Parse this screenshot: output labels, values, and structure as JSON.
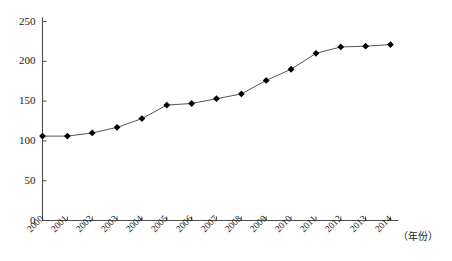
{
  "chart_data": {
    "type": "line",
    "title": "",
    "subtitle": "",
    "xlabel": "（年份）",
    "ylabel": "",
    "categories": [
      "2000",
      "2001",
      "2002",
      "2003",
      "2004",
      "2005",
      "2006",
      "2007",
      "2008",
      "2009",
      "2010",
      "2011",
      "2012",
      "2013",
      "2014"
    ],
    "values": [
      106,
      106,
      110,
      117,
      128,
      145,
      147,
      153,
      159,
      176,
      190,
      210,
      218,
      219,
      221
    ],
    "series": [
      {
        "name": "",
        "values": [
          106,
          106,
          110,
          117,
          128,
          145,
          147,
          153,
          159,
          176,
          190,
          210,
          218,
          219,
          221
        ]
      }
    ],
    "xlim": [
      0,
      14
    ],
    "ylim": [
      0,
      250
    ],
    "yticks": [
      0,
      50,
      100,
      150,
      200,
      250
    ],
    "ytick_labels": [
      "0",
      "50",
      "100",
      "150",
      "200",
      "250"
    ],
    "xtick_labels": [
      "2000",
      "2001",
      "2002",
      "2003",
      "2004",
      "2005",
      "2006",
      "2007",
      "2008",
      "2009",
      "2010",
      "2011",
      "2012",
      "2013",
      "2014"
    ],
    "grid": false,
    "legend": "none",
    "marker": "diamond",
    "line_color": "#555555",
    "marker_color": "#000000",
    "axis_color": "#4d4d4d",
    "background_color": "#ffffff",
    "xtick_label_rotation": -45
  }
}
